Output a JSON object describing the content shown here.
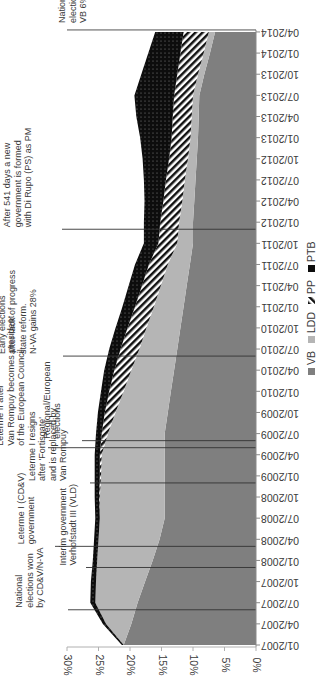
{
  "chart_data": {
    "type": "area",
    "stacked": true,
    "orientation_note": "figure rotated 90 degrees clockwise",
    "title": "",
    "xlabel": "",
    "ylabel": "",
    "ylim": [
      0,
      30
    ],
    "yticks": [
      "0%",
      "5%",
      "10%",
      "15%",
      "20%",
      "25%",
      "30%"
    ],
    "x": [
      "01/2007",
      "04/2007",
      "07/2007",
      "10/2007",
      "01/2008",
      "04/2008",
      "07/2008",
      "10/2008",
      "01/2009",
      "04/2009",
      "07/2009",
      "10/2009",
      "01/2010",
      "04/2010",
      "07/2010",
      "10/2010",
      "01/2011",
      "04/2011",
      "07/2011",
      "10/2011",
      "01/2012",
      "04/2012",
      "07/2012",
      "10/2012",
      "01/2013",
      "04/2013",
      "07/2013",
      "10/2013",
      "01/2014",
      "04/2014"
    ],
    "series": [
      {
        "name": "VB",
        "color": "#7f7f7f",
        "pattern": "solid-dark-gray",
        "values": [
          21.0,
          19.8,
          18.8,
          17.6,
          16.4,
          15.3,
          14.5,
          14.5,
          14.5,
          14.5,
          14.5,
          14.0,
          13.5,
          13.0,
          12.5,
          12.0,
          11.5,
          11.0,
          10.5,
          10.0,
          10.0,
          9.8,
          9.6,
          9.4,
          9.2,
          9.1,
          9.0,
          8.2,
          7.3,
          6.5
        ]
      },
      {
        "name": "LDD",
        "color": "#b4b4b4",
        "pattern": "solid-light-gray",
        "values": [
          0.0,
          4.0,
          6.7,
          7.8,
          8.8,
          9.7,
          10.3,
          10.3,
          10.1,
          10.0,
          9.0,
          8.3,
          7.5,
          6.8,
          6.0,
          5.4,
          4.7,
          4.1,
          3.5,
          2.5,
          2.2,
          1.9,
          1.7,
          1.4,
          1.2,
          1.1,
          1.0,
          1.0,
          1.0,
          1.0
        ]
      },
      {
        "name": "PP",
        "color": "#ffffff",
        "pattern": "diagonal-stripes",
        "values": [
          0.0,
          0.0,
          0.0,
          0.0,
          0.0,
          0.0,
          0.0,
          0.1,
          0.2,
          0.3,
          1.0,
          1.7,
          2.3,
          2.7,
          3.0,
          3.0,
          3.0,
          3.0,
          3.0,
          3.0,
          3.0,
          3.0,
          3.0,
          3.0,
          3.0,
          3.0,
          3.0,
          3.3,
          3.7,
          4.0
        ]
      },
      {
        "name": "PTB",
        "color": "#0d0d0d",
        "pattern": "dotted-black",
        "values": [
          0.3,
          0.5,
          0.8,
          0.8,
          0.7,
          0.7,
          0.7,
          0.7,
          0.8,
          0.8,
          0.9,
          1.1,
          1.3,
          1.6,
          1.8,
          1.9,
          2.0,
          2.1,
          2.2,
          2.3,
          2.6,
          3.0,
          3.5,
          4.2,
          5.0,
          5.8,
          6.3,
          5.7,
          5.1,
          4.5
        ]
      }
    ],
    "legend": {
      "position": "bottom",
      "entries": [
        "VB",
        "LDD",
        "PP",
        "PTB"
      ]
    },
    "grid": false,
    "annotations": [
      {
        "x": "06/2007",
        "text": [
          "National",
          "elections won",
          "by CD&V/N-VA"
        ]
      },
      {
        "x": "12/2007",
        "text": [
          "Interim government",
          "Verhofstadt III (VLD)"
        ]
      },
      {
        "x": "03/2008",
        "text": [
          "Leterme I (CD&V)",
          "government"
        ]
      },
      {
        "x": "12/2008",
        "text": [
          "Leterme I resigns",
          "after 'Fortisgate'",
          "and is replaced by",
          "Van Rompuy"
        ]
      },
      {
        "x": "05/2009",
        "text": [
          "Leterme II after",
          "Van Rompuy becomes president",
          "of the European Council"
        ]
      },
      {
        "x": "06/2009",
        "text": [
          "Regional/European",
          "elections"
        ]
      },
      {
        "x": "06/2010",
        "text": [
          "Early elections",
          "after lack of progress",
          "state reform.",
          "N-VA gains 28%"
        ]
      },
      {
        "x": "12/2011",
        "text": [
          "After 541 days a new",
          "government is formed",
          "with Di Rupo (PS) as PM"
        ]
      },
      {
        "x": "05/2014",
        "text": [
          "National/Regional/European",
          "elections. N-VA gains  33%,",
          "VB 6%, LDD 1%, PTB 5%, PP 4%"
        ]
      }
    ]
  }
}
